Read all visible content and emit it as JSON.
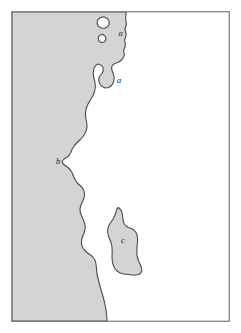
{
  "figure": {
    "type": "coastline-map",
    "title": "",
    "caption": "",
    "background_color": "#ffffff"
  },
  "frame": {
    "name": "map-border",
    "x": 11,
    "y": 11,
    "width": 219,
    "height": 311,
    "stroke_color": "#8c8c8c",
    "stroke_width": 1.4,
    "fill_color": "#ffffff"
  },
  "regions": {
    "land": {
      "name": "landmass",
      "fill_color": "#d4d4d4",
      "stroke_color": "#4a4a4a",
      "stroke_width": 1.1,
      "position": "west"
    },
    "sea": {
      "name": "sea",
      "fill_color": "#ffffff",
      "position": "east"
    }
  },
  "islands": [
    {
      "id": "island-1",
      "shape": "rounded-blob",
      "cx": 103.5,
      "cy": 22.5,
      "fill_color": "#ffffff",
      "stroke_color": "#4a4a4a"
    },
    {
      "id": "island-2",
      "shape": "small-diamond",
      "cx": 102.5,
      "cy": 38.5,
      "fill_color": "#ffffff",
      "stroke_color": "#4a4a4a"
    }
  ],
  "labels": [
    {
      "id": "label-a-upper",
      "text": "a",
      "x": 120.5,
      "y": 34.0
    },
    {
      "id": "label-a-lower",
      "text": "a",
      "x": 119.0,
      "y": 81.5
    },
    {
      "id": "label-b",
      "text": "b",
      "x": 58.0,
      "y": 162.5
    },
    {
      "id": "label-c",
      "text": "c",
      "x": 123.0,
      "y": 241.0
    }
  ],
  "paths": {
    "coastline_land": "M 12,12 L 126.2,12 L 125.6,18.5 L 126.4,24.0 L 125.0,29.5 L 126.2,34.5 L 124.6,40.0 L 125.4,45.5 L 123.6,50.5 L 124.4,55.5 L 122.0,59.5 L 119.0,62.0 L 116.0,63.0 L 113.2,64.5 L 111.6,67.0 L 112.0,70.5 L 113.4,74.0 L 114.2,78.0 L 113.6,82.0 L 111.6,85.5 L 108.6,87.5 L 105.2,88.0 L 102.0,86.5 L 99.6,83.5 L 98.6,80.0 L 99.4,76.5 L 101.6,74.0 L 103.2,71.0 L 103.0,67.5 L 101.0,65.0 L 98.2,64.0 L 95.6,65.5 L 94.0,68.5 L 93.2,72.5 L 93.6,77.0 L 94.8,81.5 L 95.4,86.5 L 94.6,91.5 L 92.8,96.0 L 90.4,100.0 L 88.0,104.0 L 86.2,108.5 L 85.4,113.5 L 85.8,118.5 L 86.8,123.0 L 87.0,127.5 L 85.8,132.0 L 83.4,136.0 L 80.4,139.5 L 77.2,142.5 L 74.4,145.5 L 72.2,149.0 L 70.8,152.5 L 69.0,155.5 L 66.6,157.5 L 64.0,159.0 L 62.2,161.0 L 62.8,163.5 L 65.2,165.5 L 68.0,167.5 L 70.4,170.0 L 72.2,173.0 L 73.6,176.5 L 75.2,180.0 L 77.4,183.0 L 80.0,185.5 L 82.4,188.0 L 84.0,191.0 L 84.6,194.5 L 84.0,198.0 L 82.6,201.5 L 81.0,205.0 L 80.0,208.5 L 80.2,212.0 L 81.4,215.5 L 83.0,219.0 L 84.4,222.5 L 85.2,226.0 L 85.0,229.5 L 84.0,233.0 L 82.6,236.5 L 81.6,240.0 L 81.4,243.5 L 82.4,247.0 L 84.4,250.0 L 87.0,252.5 L 89.8,254.5 L 92.4,256.5 L 94.4,259.0 L 95.6,262.0 L 96.2,265.5 L 96.6,270.0 L 97.2,275.0 L 98.4,280.0 L 99.8,285.5 L 101.4,291.0 L 103.0,296.5 L 104.6,302.5 L 105.8,308.5 L 106.6,315.0 L 107.0,321.0 L 12,321.0 Z",
    "island_c": "M 118.4,207.5 L 120.6,209.5 L 122.0,212.5 L 122.6,216.0 L 123.0,220.0 L 124.0,223.5 L 126.0,226.0 L 128.6,227.5 L 131.4,228.5 L 134.0,230.0 L 136.0,232.5 L 137.2,235.5 L 137.6,239.0 L 137.4,243.0 L 137.0,247.5 L 136.8,252.0 L 137.2,256.5 L 138.4,260.5 L 140.0,264.0 L 141.4,267.5 L 141.8,270.5 L 140.8,273.0 L 138.6,274.5 L 135.6,275.0 L 132.0,275.0 L 128.0,274.5 L 124.0,274.0 L 120.2,273.0 L 117.0,271.0 L 114.6,268.0 L 113.0,264.5 L 112.2,260.5 L 112.0,256.0 L 112.2,251.5 L 112.0,247.0 L 111.2,243.0 L 109.8,239.5 L 108.4,236.0 L 107.6,232.0 L 108.0,228.0 L 109.4,224.5 L 111.4,221.5 L 113.4,218.5 L 115.0,215.0 L 116.2,211.5 L 117.2,208.5 Z",
    "island_1": "M 103.8,16.8 L 107.2,18.4 L 109.0,21.0 L 109.2,24.2 L 107.6,26.8 L 104.6,28.2 L 101.2,28.0 L 98.4,26.2 L 97.0,23.2 L 97.6,20.0 L 100.0,17.6 Z",
    "island_2": "M 102.6,34.2 L 105.4,36.4 L 106.0,39.4 L 104.2,42.0 L 101.2,42.6 L 98.8,40.8 L 98.2,37.8 L 99.8,35.2 Z"
  }
}
